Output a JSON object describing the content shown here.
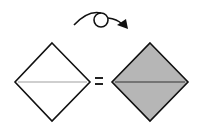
{
  "diagram": {
    "type": "origami-step",
    "instruction_symbol": "turn-over",
    "description": "Turn the paper over",
    "before": {
      "shape": "square-diamond",
      "fill": "#ffffff",
      "crease": "horizontal-valley",
      "crease_color": "#a0a0a0"
    },
    "operator": "=",
    "after": {
      "shape": "square-diamond",
      "fill": "#b6b6b6",
      "crease": "horizontal",
      "crease_color": "#333333"
    },
    "colors": {
      "outline": "#111111",
      "paper_front": "#ffffff",
      "paper_back": "#b6b6b6"
    }
  }
}
